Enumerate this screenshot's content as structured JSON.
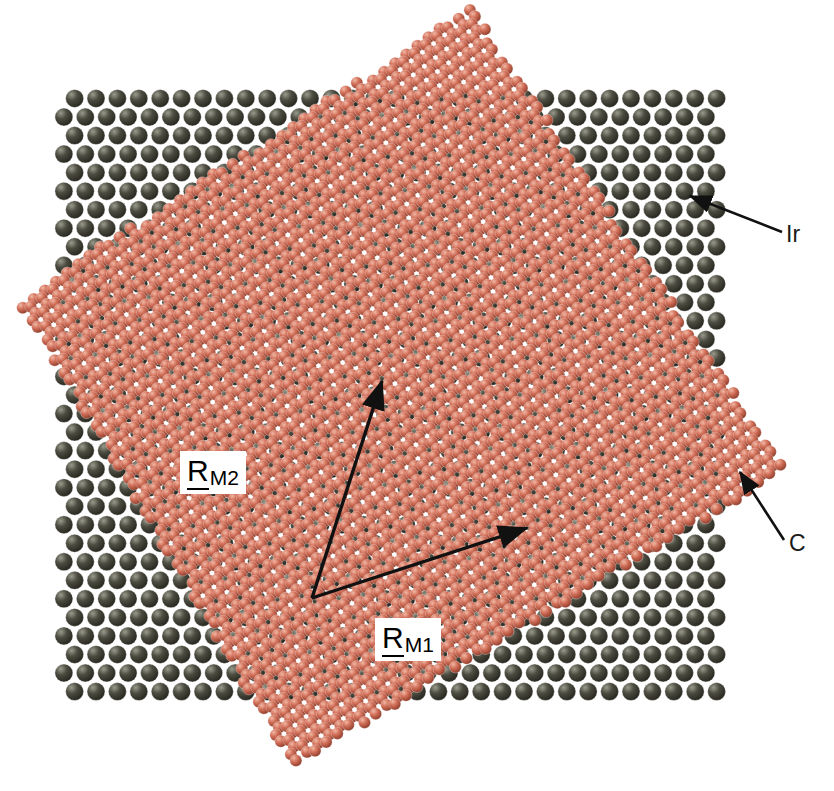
{
  "figure": {
    "width": 834,
    "height": 791,
    "background": "#ffffff"
  },
  "species": [
    {
      "id": "ir",
      "label": "Ir",
      "name": "iridium-substrate-atom",
      "color": "#4c4c41",
      "highlight": "#9a9a8c",
      "shadow": "#24241d",
      "radius": 9.0,
      "label_x": 786,
      "label_y": 221
    },
    {
      "id": "c",
      "label": "C",
      "name": "carbon-graphene-atom",
      "color": "#d3705a",
      "highlight": "#f0b9a5",
      "shadow": "#8a3a28",
      "radius": 6.0,
      "label_x": 789,
      "label_y": 530
    }
  ],
  "leaders": [
    {
      "name": "ir-leader-line",
      "from_x": 782,
      "from_y": 232,
      "to_x": 690,
      "to_y": 196,
      "target_species": "ir"
    },
    {
      "name": "c-leader-line",
      "from_x": 784,
      "from_y": 540,
      "to_x": 740,
      "to_y": 472,
      "target_species": "c"
    }
  ],
  "vectors": [
    {
      "id": "RM1",
      "symbol": "R",
      "subscript": "M1",
      "name": "moire-lattice-vector-1",
      "origin_x": 312,
      "origin_y": 598,
      "tip_x": 527,
      "tip_y": 528,
      "label_x": 375,
      "label_y": 618
    },
    {
      "id": "RM2",
      "symbol": "R",
      "subscript": "M2",
      "name": "moire-lattice-vector-2",
      "origin_x": 312,
      "origin_y": 598,
      "tip_x": 382,
      "tip_y": 381,
      "label_x": 180,
      "label_y": 451
    }
  ],
  "substrate": {
    "name": "iridium-substrate-lattice",
    "lattice": "hexagonal",
    "a_px": 21.4,
    "rotation_deg": 0,
    "origin_x": 417,
    "origin_y": 395,
    "clip_x0": 62,
    "clip_y0": 97,
    "clip_x1": 716,
    "clip_y1": 694
  },
  "graphene": {
    "name": "graphene-honeycomb-sheet",
    "lattice": "honeycomb",
    "a_px": 14.1,
    "bond_px": 8.14,
    "rotation_deg": 22.0,
    "origin_x": 400,
    "origin_y": 390,
    "rhombus": [
      {
        "x": 471,
        "y": 8
      },
      {
        "x": 786,
        "y": 470
      },
      {
        "x": 293,
        "y": 766
      },
      {
        "x": 18,
        "y": 300
      }
    ]
  },
  "chart_data": {
    "type": "scatter",
    "xlabel": "",
    "ylabel": "",
    "legend": [
      "Ir",
      "C"
    ],
    "series": [
      {
        "name": "Ir",
        "description": "Hexagonal close-packed iridium (111) substrate atoms, dark olive spheres, lattice constant 21.4 px, unrotated",
        "color": "#4c4c41",
        "marker_radius_px": 9.0,
        "lattice_a_px": 21.4,
        "rotation_deg": 0
      },
      {
        "name": "C",
        "description": "Graphene honeycomb carbon atoms, salmon spheres, rotated 22 deg relative to substrate, forming a rhombic sheet",
        "color": "#d3705a",
        "marker_radius_px": 6.0,
        "lattice_a_px": 14.1,
        "rotation_deg": 22
      }
    ],
    "annotations": [
      {
        "text": "Ir",
        "x": 786,
        "y": 221
      },
      {
        "text": "C",
        "x": 789,
        "y": 530
      },
      {
        "text": "R_M1",
        "x": 375,
        "y": 618
      },
      {
        "text": "R_M2",
        "x": 180,
        "y": 451
      }
    ]
  }
}
